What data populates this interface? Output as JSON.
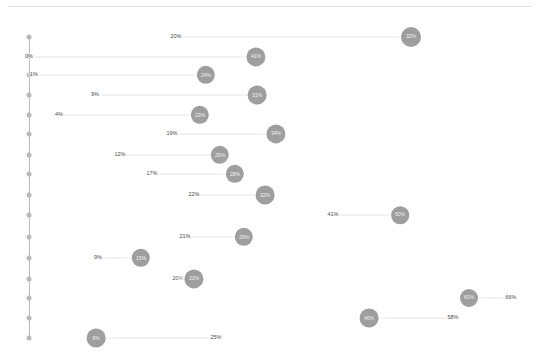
{
  "chart_data": {
    "type": "scatter",
    "title": "",
    "subtitle": "",
    "xlabel": "",
    "ylabel": "",
    "xlim": [
      0,
      75
    ],
    "ylim": [
      0,
      18
    ],
    "grid": false,
    "legend": null,
    "axis": {
      "spine_color": "#b9b9b9",
      "dot_color": "#9a9a9a",
      "dot_count": 18
    },
    "series": [
      {
        "name": "start",
        "values": [
          20,
          0,
          1,
          9,
          4,
          19,
          12,
          17,
          22,
          41,
          21,
          9,
          20,
          66,
          58,
          25
        ]
      },
      {
        "name": "end",
        "values": [
          32,
          41,
          24,
          31,
          23,
          34,
          26,
          28,
          32,
          50,
          29,
          15,
          22,
          60,
          46,
          9
        ]
      }
    ],
    "rows": [
      {
        "id": "row-1",
        "start_label": "20%",
        "start_value": 20,
        "end_label": "32%",
        "end_value": 32,
        "start_x": 176,
        "end_x": 411,
        "y": 37,
        "r": 10.0,
        "node_side": "right",
        "axis_dot": true
      },
      {
        "id": "row-2",
        "start_label": "0%",
        "start_value": 0,
        "end_label": "41%",
        "end_value": 41,
        "start_x": 29,
        "end_x": 256,
        "y": 57,
        "r": 9.6,
        "node_side": "right",
        "axis_dot": true
      },
      {
        "id": "row-3",
        "start_label": "1%",
        "start_value": 1,
        "end_label": "24%",
        "end_value": 24,
        "start_x": 34,
        "end_x": 206,
        "y": 75,
        "r": 9.2,
        "node_side": "right",
        "axis_dot": true
      },
      {
        "id": "row-4",
        "start_label": "9%",
        "start_value": 9,
        "end_label": "31%",
        "end_value": 31,
        "start_x": 95,
        "end_x": 257,
        "y": 95,
        "r": 9.4,
        "node_side": "right",
        "axis_dot": true
      },
      {
        "id": "row-5",
        "start_label": "4%",
        "start_value": 4,
        "end_label": "23%",
        "end_value": 23,
        "start_x": 59,
        "end_x": 200,
        "y": 115,
        "r": 9.2,
        "node_side": "right",
        "axis_dot": true
      },
      {
        "id": "row-6",
        "start_label": "19%",
        "start_value": 19,
        "end_label": "34%",
        "end_value": 34,
        "start_x": 172,
        "end_x": 276,
        "y": 134,
        "r": 9.6,
        "node_side": "right",
        "axis_dot": true
      },
      {
        "id": "row-7",
        "start_label": "12%",
        "start_value": 12,
        "end_label": "26%",
        "end_value": 26,
        "start_x": 120,
        "end_x": 220,
        "y": 155,
        "r": 9.2,
        "node_side": "right",
        "axis_dot": true
      },
      {
        "id": "row-8",
        "start_label": "17%",
        "start_value": 17,
        "end_label": "28%",
        "end_value": 28,
        "start_x": 152,
        "end_x": 235,
        "y": 174,
        "r": 9.2,
        "node_side": "right",
        "axis_dot": true
      },
      {
        "id": "row-9",
        "start_label": "22%",
        "start_value": 22,
        "end_label": "32%",
        "end_value": 32,
        "start_x": 194,
        "end_x": 265,
        "y": 195,
        "r": 9.4,
        "node_side": "right",
        "axis_dot": true
      },
      {
        "id": "row-10",
        "start_label": "41%",
        "start_value": 41,
        "end_label": "50%",
        "end_value": 50,
        "start_x": 333,
        "end_x": 400,
        "y": 215,
        "r": 8.8,
        "node_side": "right",
        "axis_dot": true
      },
      {
        "id": "row-11",
        "start_label": "21%",
        "start_value": 21,
        "end_label": "29%",
        "end_value": 29,
        "start_x": 185,
        "end_x": 244,
        "y": 237,
        "r": 9.2,
        "node_side": "right",
        "axis_dot": true
      },
      {
        "id": "row-12",
        "start_label": "9%",
        "start_value": 9,
        "end_label": "15%",
        "end_value": 15,
        "start_x": 98,
        "end_x": 141,
        "y": 258,
        "r": 9.2,
        "node_side": "right",
        "axis_dot": true
      },
      {
        "id": "row-13",
        "start_label": "20%",
        "start_value": 20,
        "end_label": "22%",
        "end_value": 22,
        "start_x": 178,
        "end_x": 194,
        "y": 279,
        "r": 9.6,
        "node_side": "right",
        "axis_dot": true
      },
      {
        "id": "row-14",
        "start_label": "66%",
        "start_value": 66,
        "end_label": "60%",
        "end_value": 60,
        "start_x": 511,
        "end_x": 469,
        "y": 298,
        "r": 9.0,
        "node_side": "left",
        "axis_dot": true
      },
      {
        "id": "row-15",
        "start_label": "58%",
        "start_value": 58,
        "end_label": "46%",
        "end_value": 46,
        "start_x": 453,
        "end_x": 369,
        "y": 318,
        "r": 9.4,
        "node_side": "left",
        "axis_dot": true
      },
      {
        "id": "row-16",
        "start_label": "25%",
        "start_value": 25,
        "end_label": "9%",
        "end_value": 9,
        "start_x": 216,
        "end_x": 96,
        "y": 338,
        "r": 9.4,
        "node_side": "left",
        "axis_dot": true
      }
    ],
    "axis_dot_positions": [
      {
        "x": 29,
        "y": 37
      },
      {
        "x": 29,
        "y": 57
      },
      {
        "x": 29,
        "y": 75
      },
      {
        "x": 29,
        "y": 95
      },
      {
        "x": 29,
        "y": 115
      },
      {
        "x": 29,
        "y": 134
      },
      {
        "x": 29,
        "y": 155
      },
      {
        "x": 29,
        "y": 174
      },
      {
        "x": 29,
        "y": 195
      },
      {
        "x": 29,
        "y": 215
      },
      {
        "x": 29,
        "y": 237
      },
      {
        "x": 29,
        "y": 258
      },
      {
        "x": 29,
        "y": 279
      },
      {
        "x": 29,
        "y": 298
      },
      {
        "x": 29,
        "y": 318
      },
      {
        "x": 29,
        "y": 338
      }
    ],
    "colors": {
      "node_fill": "#9e9e9e",
      "node_text": "#efefef",
      "label_text": "#4a4a4a",
      "connector": "#e4e4e4",
      "axis": "#b9b9b9",
      "background": "#ffffff",
      "top_rule": "#e2e2e2"
    }
  }
}
